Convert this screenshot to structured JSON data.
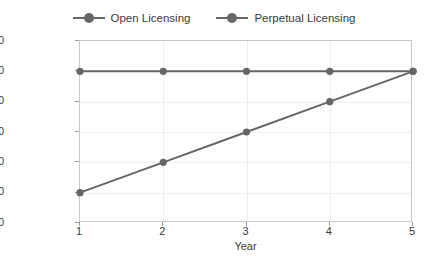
{
  "chart_data": {
    "type": "line",
    "title": "",
    "xlabel": "Year",
    "ylabel": "Total Cost of Ownership, USD",
    "x": [
      1,
      2,
      3,
      4,
      5
    ],
    "xtick_labels": [
      "1",
      "2",
      "3",
      "4",
      "5"
    ],
    "xlim": [
      1,
      5
    ],
    "ylim": [
      0,
      300000
    ],
    "ytick_values": [
      0,
      50000,
      100000,
      150000,
      200000,
      250000,
      300000
    ],
    "ytick_labels": [
      "$0",
      "$50,000",
      "$100,000",
      "$150,000",
      "$200,000",
      "$250,000",
      "$300,000"
    ],
    "grid": true,
    "legend_position": "top-center",
    "series": [
      {
        "name": "Open Licensing",
        "color": "#666666",
        "marker": "circle",
        "values": [
          250000,
          250000,
          250000,
          250000,
          250000
        ]
      },
      {
        "name": "Perpetual Licensing",
        "color": "#666666",
        "marker": "circle",
        "values": [
          50000,
          100000,
          150000,
          200000,
          250000
        ]
      }
    ]
  },
  "legend": {
    "entries": [
      {
        "label": "Open Licensing"
      },
      {
        "label": "Perpetual Licensing"
      }
    ]
  },
  "axes": {
    "x_title": "Year",
    "y_title": "Total Cost of Ownership, USD"
  },
  "colors": {
    "series_gray": "#666666",
    "grid": "#eeeeee",
    "axis_border": "#c8c8c8",
    "text": "#3a3a3a"
  }
}
